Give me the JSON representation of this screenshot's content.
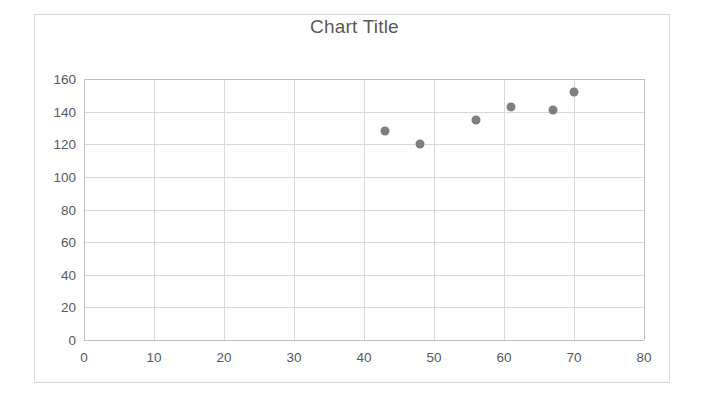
{
  "chart_data": {
    "type": "scatter",
    "title": "Chart Title",
    "xlabel": "",
    "ylabel": "",
    "xlim": [
      0,
      80
    ],
    "ylim": [
      0,
      160
    ],
    "x_ticks": [
      0,
      10,
      20,
      30,
      40,
      50,
      60,
      70,
      80
    ],
    "y_ticks": [
      0,
      20,
      40,
      60,
      80,
      100,
      120,
      140,
      160
    ],
    "grid": true,
    "legend": false,
    "marker_color": "#7f7f7f",
    "series": [
      {
        "name": "Series 1",
        "points": [
          {
            "x": 43,
            "y": 128
          },
          {
            "x": 48,
            "y": 120
          },
          {
            "x": 56,
            "y": 135
          },
          {
            "x": 61,
            "y": 143
          },
          {
            "x": 67,
            "y": 141
          },
          {
            "x": 70,
            "y": 152
          }
        ]
      }
    ]
  },
  "colors": {
    "marker": "#7f7f7f",
    "grid": "#d9d9d9",
    "axis": "#bfbfbf",
    "text": "#595959",
    "frame": "#d9d9d9"
  }
}
